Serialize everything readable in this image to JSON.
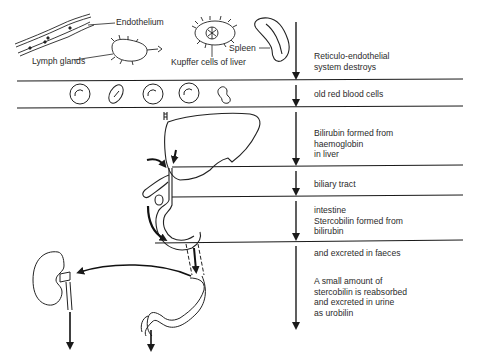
{
  "diagram": {
    "organ_labels": {
      "endothelium": "Endothelium",
      "lymph_glands": "Lymph glands",
      "kupffer": "Kupffer cells of liver",
      "spleen": "Spleen"
    },
    "steps": [
      {
        "id": "reticulo",
        "text": "Reticulo-endothelial\nsystem destroys"
      },
      {
        "id": "old-rbc",
        "text": "old red blood cells"
      },
      {
        "id": "bilirubin",
        "text": "Bilirubin formed from\nhaemoglobin\nin liver"
      },
      {
        "id": "biliary",
        "text": "biliary tract"
      },
      {
        "id": "intestine",
        "text": "intestine\nStercobilin formed from\nbilirubin"
      },
      {
        "id": "faeces",
        "text": "and excreted in faeces"
      },
      {
        "id": "urine",
        "text": "A small amount of\nstercobilin is reabsorbed\nand excreted in urine\nas urobilin"
      }
    ],
    "colors": {
      "line": "#1a1a1a",
      "background": "#ffffff"
    }
  }
}
